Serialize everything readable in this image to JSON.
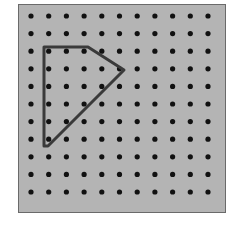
{
  "geoboard": {
    "rows": 11,
    "cols": 11,
    "origin": [
      31,
      16
    ],
    "spacing": [
      17.7,
      17.6
    ],
    "board_color": "#b4b4b4",
    "peg_color": "#111111",
    "band_color": "#3a3a3a"
  },
  "shape": {
    "type": "quadrilateral",
    "points": [
      [
        44,
        47
      ],
      [
        88,
        47
      ],
      [
        124,
        70
      ],
      [
        48,
        146
      ],
      [
        44,
        146
      ]
    ]
  }
}
